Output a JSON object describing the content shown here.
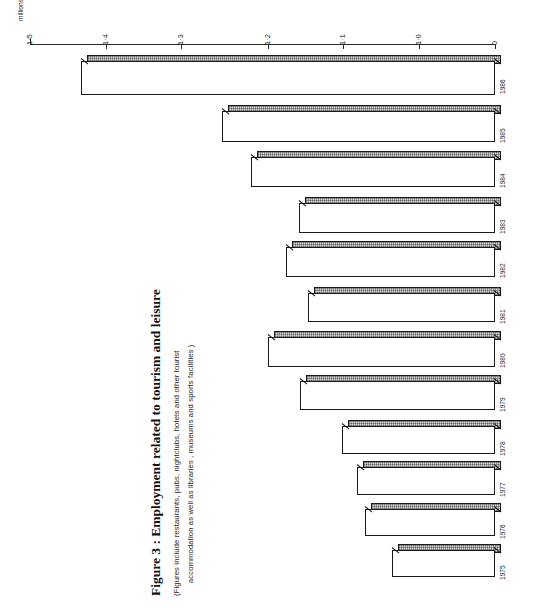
{
  "figure": {
    "title": "Figure 3 : Employment related to tourism and leisure",
    "subtitle_line_1": "(Figures include  restaurants, pubs, nightclubs, hotels  and  other  tourist",
    "subtitle_line_2": "accommodation  as  well  as  libraries , museums  and  sports  facilities )",
    "axis_unit_label": "millions"
  },
  "axis": {
    "ticks": [
      {
        "label": "1·5",
        "value": 1.5,
        "x": 30
      },
      {
        "label": "1·4",
        "value": 1.4,
        "x": 106
      },
      {
        "label": "1·3",
        "value": 1.3,
        "x": 181
      },
      {
        "label": "1·2",
        "value": 1.2,
        "x": 268
      },
      {
        "label": "1·1",
        "value": 1.1,
        "x": 343
      },
      {
        "label": "1·0",
        "value": 1.0,
        "x": 419
      },
      {
        "label": "0",
        "value": 0.0,
        "x": 495
      }
    ]
  },
  "bars": [
    {
      "year": "1986",
      "value": 1.425,
      "left": 81,
      "top": 55,
      "height": 40
    },
    {
      "year": "1985",
      "value": 1.288,
      "left": 222,
      "top": 105,
      "height": 37
    },
    {
      "year": "1984",
      "value": 1.258,
      "left": 251,
      "top": 151,
      "height": 36
    },
    {
      "year": "1983",
      "value": 1.192,
      "left": 299,
      "top": 197,
      "height": 36
    },
    {
      "year": "1982",
      "value": 1.18,
      "left": 286,
      "top": 241,
      "height": 36
    },
    {
      "year": "1981",
      "value": 1.15,
      "left": 308,
      "top": 287,
      "height": 35
    },
    {
      "year": "1980",
      "value": 1.208,
      "left": 268,
      "top": 331,
      "height": 36
    },
    {
      "year": "1979",
      "value": 1.142,
      "left": 300,
      "top": 375,
      "height": 35
    },
    {
      "year": "1978",
      "value": 1.088,
      "left": 342,
      "top": 420,
      "height": 34
    },
    {
      "year": "1977",
      "value": 1.08,
      "left": 357,
      "top": 461,
      "height": 34
    },
    {
      "year": "1976",
      "value": 1.065,
      "left": 365,
      "top": 503,
      "height": 33
    },
    {
      "year": "1975",
      "value": 1.04,
      "left": 392,
      "top": 544,
      "height": 33
    }
  ],
  "chart_data": {
    "type": "bar",
    "title": "Figure 3 : Employment related to tourism and leisure",
    "subtitle": "(Figures include restaurants, pubs, nightclubs, hotels and other tourist accommodation as well as libraries, museums and sports facilities )",
    "orientation": "horizontal",
    "xlabel": "",
    "ylabel": "millions",
    "unit": "millions",
    "xlim": [
      0,
      1.5
    ],
    "grid": false,
    "legend": "none",
    "categories": [
      "1975",
      "1976",
      "1977",
      "1978",
      "1979",
      "1980",
      "1981",
      "1982",
      "1983",
      "1984",
      "1985",
      "1986"
    ],
    "values": [
      1.04,
      1.065,
      1.08,
      1.088,
      1.142,
      1.208,
      1.15,
      1.18,
      1.192,
      1.258,
      1.288,
      1.425
    ],
    "tick_labels": [
      "0",
      "1·0",
      "1·1",
      "1·2",
      "1·3",
      "1·4",
      "1·5"
    ],
    "tick_values": [
      0,
      1.0,
      1.1,
      1.2,
      1.3,
      1.4,
      1.5
    ],
    "axis_note": "Value axis is broken between 0 and 1·0"
  }
}
